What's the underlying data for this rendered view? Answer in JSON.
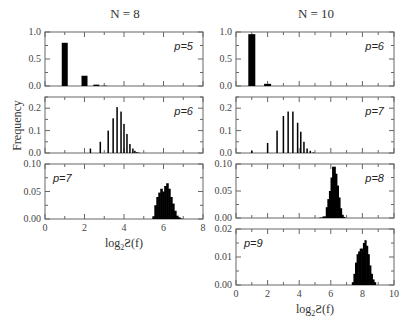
{
  "figure": {
    "ylabel": "Frequency",
    "xlabel_main": "log",
    "xlabel_sub": "2",
    "xlabel_rest": "Ƨ(f)",
    "columns": [
      {
        "title": "N = 8"
      },
      {
        "title": "N = 10"
      }
    ]
  },
  "chart_data": [
    {
      "type": "bar",
      "column": "N = 8",
      "label": "p=5",
      "xlim": [
        0,
        8
      ],
      "ylim": [
        0,
        1.0
      ],
      "yticks": [
        0.0,
        0.5,
        1.0
      ],
      "ytick_labels": [
        "0.0",
        "0.5",
        "1.0"
      ],
      "x": [
        1,
        2,
        2.6,
        3
      ],
      "values": [
        0.8,
        0.19,
        0.025,
        0.005
      ]
    },
    {
      "type": "bar",
      "column": "N = 8",
      "label": "p=6",
      "xlim": [
        0,
        8
      ],
      "ylim": [
        0,
        0.25
      ],
      "yticks": [
        0.0,
        0.1,
        0.2
      ],
      "ytick_labels": [
        "0.0",
        "0.1",
        "0.2"
      ],
      "x": [
        2.3,
        2.8,
        3.2,
        3.45,
        3.65,
        3.85,
        4.0,
        4.15,
        4.3,
        4.45,
        4.55,
        4.65,
        4.75
      ],
      "values": [
        0.02,
        0.05,
        0.1,
        0.155,
        0.205,
        0.185,
        0.13,
        0.085,
        0.04,
        0.02,
        0.01,
        0.004,
        0.002
      ]
    },
    {
      "type": "histogram",
      "column": "N = 8",
      "label": "p=7",
      "xlim": [
        0,
        8
      ],
      "ylim": [
        0,
        0.1
      ],
      "yticks": [
        0.0,
        0.05,
        0.1
      ],
      "ytick_labels": [
        "0.00",
        "0.05",
        "0.10"
      ],
      "xticks": [
        0,
        2,
        4,
        6,
        8
      ],
      "x": [
        5.5,
        5.6,
        5.7,
        5.8,
        5.9,
        6.0,
        6.1,
        6.2,
        6.3,
        6.4,
        6.5,
        6.6,
        6.7,
        6.8,
        6.9
      ],
      "values": [
        0.005,
        0.025,
        0.04,
        0.048,
        0.055,
        0.05,
        0.06,
        0.065,
        0.055,
        0.04,
        0.028,
        0.015,
        0.006,
        0.003,
        0.001
      ]
    },
    {
      "type": "bar",
      "column": "N = 10",
      "label": "p=6",
      "xlim": [
        0,
        10
      ],
      "ylim": [
        0,
        1.0
      ],
      "yticks": [
        0.0,
        0.5,
        1.0
      ],
      "ytick_labels": [
        "0.0",
        "0.5",
        "1.0"
      ],
      "x": [
        1,
        2
      ],
      "values": [
        0.96,
        0.04
      ]
    },
    {
      "type": "bar",
      "column": "N = 10",
      "label": "p=7",
      "xlim": [
        0,
        10
      ],
      "ylim": [
        0,
        0.25
      ],
      "yticks": [
        0.0,
        0.1,
        0.2
      ],
      "ytick_labels": [
        "0.0",
        "0.1",
        "0.2"
      ],
      "x": [
        1,
        2,
        2.6,
        3.0,
        3.3,
        3.6,
        3.9,
        4.1,
        4.3,
        4.5,
        4.7,
        4.9
      ],
      "values": [
        0.01,
        0.045,
        0.1,
        0.165,
        0.185,
        0.185,
        0.135,
        0.095,
        0.05,
        0.02,
        0.01,
        0.003
      ]
    },
    {
      "type": "histogram",
      "column": "N = 10",
      "label": "p=8",
      "xlim": [
        0,
        10
      ],
      "ylim": [
        0,
        0.1
      ],
      "yticks": [
        0.0,
        0.05,
        0.1
      ],
      "ytick_labels": [
        "0.00",
        "0.05",
        "0.10"
      ],
      "x": [
        5.4,
        5.6,
        5.8,
        5.9,
        6.0,
        6.1,
        6.2,
        6.3,
        6.4,
        6.5,
        6.6,
        6.7,
        6.8
      ],
      "values": [
        0.001,
        0.003,
        0.02,
        0.035,
        0.05,
        0.075,
        0.095,
        0.082,
        0.06,
        0.038,
        0.018,
        0.006,
        0.002
      ]
    },
    {
      "type": "histogram",
      "column": "N = 10",
      "label": "p=9",
      "xlim": [
        0,
        10
      ],
      "ylim": [
        0,
        0.02
      ],
      "yticks": [
        0.0,
        0.01,
        0.02
      ],
      "ytick_labels": [
        "0.00",
        "0.01",
        "0.02"
      ],
      "xticks": [
        0,
        2,
        4,
        6,
        8,
        10
      ],
      "x": [
        7.4,
        7.5,
        7.6,
        7.7,
        7.8,
        7.9,
        8.0,
        8.1,
        8.2,
        8.3,
        8.4,
        8.5,
        8.6,
        8.7,
        8.8
      ],
      "values": [
        0.001,
        0.004,
        0.008,
        0.011,
        0.012,
        0.013,
        0.013,
        0.015,
        0.016,
        0.014,
        0.011,
        0.007,
        0.004,
        0.002,
        0.001
      ]
    }
  ]
}
